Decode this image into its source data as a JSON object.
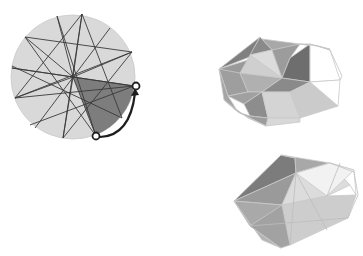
{
  "figure": {
    "width": 363,
    "height": 256,
    "background": "#ffffff",
    "colors": {
      "light": "#d9d9d9",
      "mid": "#b5b5b5",
      "dark": "#8a8a8a",
      "darker": "#767676",
      "line": "#3a3a3a",
      "outline": "#c8c8c8",
      "arrow": "#1e1e1e"
    }
  },
  "disk": {
    "center": [
      73,
      77
    ],
    "radius": 62,
    "fill": "#d9d9d9",
    "vertices": [
      [
        82,
        14
      ],
      [
        25,
        37
      ],
      [
        132,
        52
      ],
      [
        15,
        98
      ],
      [
        63,
        138
      ],
      [
        134,
        86
      ],
      [
        96,
        136
      ],
      [
        118,
        120
      ],
      [
        40,
        128
      ],
      [
        30,
        52
      ],
      [
        102,
        22
      ],
      [
        57,
        20
      ]
    ],
    "star_edges": [
      [
        0,
        3
      ],
      [
        0,
        4
      ],
      [
        1,
        2
      ],
      [
        1,
        5
      ],
      [
        2,
        3
      ],
      [
        3,
        5
      ],
      [
        4,
        2
      ],
      [
        4,
        1
      ],
      [
        0,
        8
      ],
      [
        9,
        7
      ],
      [
        10,
        8
      ],
      [
        11,
        7
      ]
    ],
    "highlight_sector": {
      "from": [
        73,
        77
      ],
      "p1": [
        134,
        86
      ],
      "p2": [
        96,
        136
      ],
      "fill": "#7a7a7a"
    },
    "arrow": {
      "start": [
        96,
        136
      ],
      "end": [
        134,
        86
      ],
      "marker_radius": 3.5
    }
  },
  "shape_top": {
    "label": "folded-triangulated-cap-1"
  },
  "shape_bottom": {
    "label": "folded-triangulated-cap-2"
  }
}
